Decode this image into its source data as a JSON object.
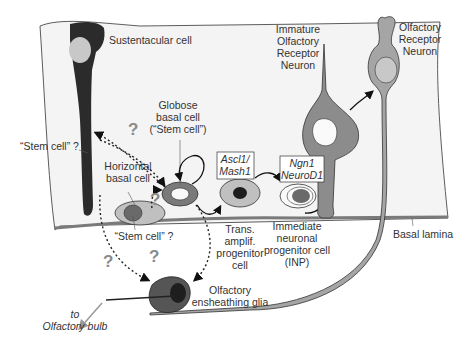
{
  "labels": {
    "sustentacular": "Sustentacular cell",
    "globose": [
      "Globose",
      "basal cell",
      "(“Stem cell”)"
    ],
    "stem_left": "“Stem cell” ?",
    "horizontal": [
      "Horizontal",
      "basal cell"
    ],
    "stem_bottom": "“Stem cell” ?",
    "ascl1": [
      "Ascl1/",
      "Mash1"
    ],
    "ngn1": [
      "Ngn1",
      "NeuroD1"
    ],
    "immature": [
      "Immature",
      "Olfactory",
      "Receptor",
      "Neuron"
    ],
    "orn": [
      "Olfactory",
      "Receptor",
      "Neuron"
    ],
    "tap": [
      "Trans.",
      "amplif.",
      "progenitor",
      "cell"
    ],
    "inp": [
      "Immediate",
      "neuronal",
      "progenitor cell",
      "(INP)"
    ],
    "basal_lamina": "Basal lamina",
    "oeg": [
      "Olfactory",
      "ensheathing glia"
    ],
    "bulb": [
      "to",
      "Olfactory bulb"
    ],
    "question": "?"
  },
  "colors": {
    "dark": "#2b2b2b",
    "mid": "#8c8c8c",
    "light": "#c8c8c8",
    "lamina": "#7a7a7a",
    "epithelium": "#f4f4f4"
  }
}
